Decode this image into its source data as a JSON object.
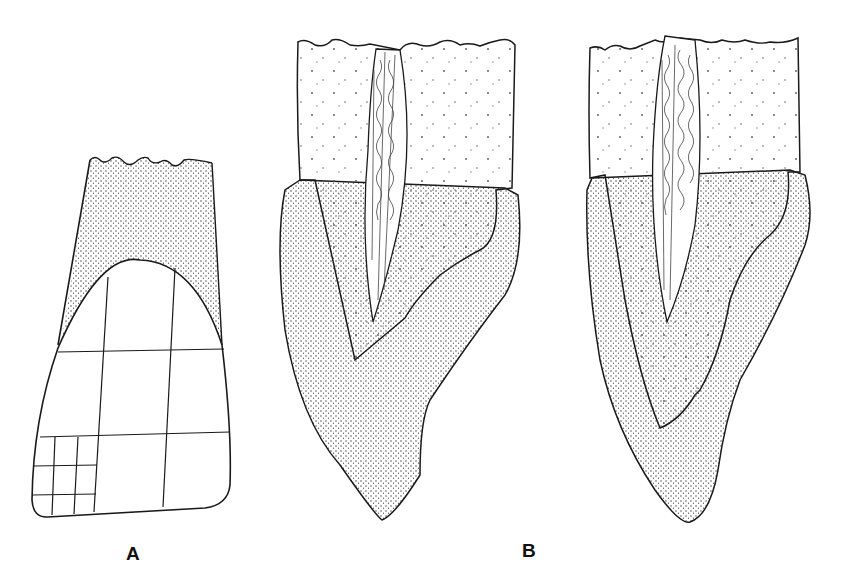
{
  "figure": {
    "panels": [
      {
        "id": "A",
        "label": "A",
        "description": "Tooth crown with grid overlay and stippled root region"
      },
      {
        "id": "B",
        "label": "B",
        "description": "Two sectioned teeth showing pulp canal, dentin and stippled outer layer"
      }
    ],
    "colors": {
      "ink": "#1a1a1a",
      "paper": "#ffffff",
      "stipple": "#333333"
    }
  }
}
